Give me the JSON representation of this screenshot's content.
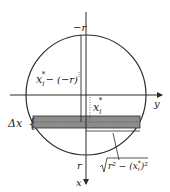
{
  "diagram": {
    "axis_labels": {
      "top": "−r",
      "bottom": "r",
      "x_axis": "x",
      "y_axis": "y"
    },
    "annotations": {
      "distance_from_top": "x_i* − (−r)",
      "distance_from_center": "x_i*",
      "strip_thickness": "Δx",
      "half_width": "√(r² − (x_i*)²)"
    },
    "parts": {
      "xi_base": "x",
      "xi_sub": "i",
      "star": "*",
      "minus_neg_r": "− (−r)",
      "delta_x": "Δx",
      "r_sq_minus": "r² − (x",
      "close_sq": ")²"
    },
    "colors": {
      "line": "#2a2a2a",
      "strip_fill": "#8c8c8c"
    }
  }
}
